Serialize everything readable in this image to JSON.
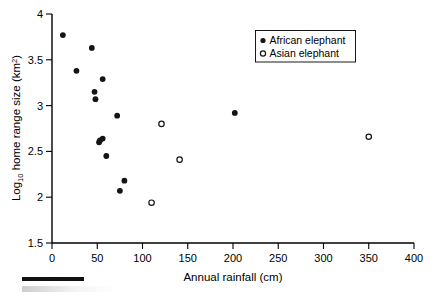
{
  "chart_data": {
    "type": "scatter",
    "title": "",
    "xlabel": "Annual rainfall (cm)",
    "ylabel": "Log10 home range size (km2)",
    "ylabel_parts": {
      "prefix": "Log",
      "sub": "10",
      "middle": " home range size (km",
      "sup": "2",
      "suffix": ")"
    },
    "xlim": [
      0,
      400
    ],
    "ylim": [
      1.5,
      4
    ],
    "xticks": [
      0,
      50,
      100,
      150,
      200,
      250,
      300,
      350,
      400
    ],
    "xtick_labels": [
      "0",
      "50",
      "100",
      "150",
      "200",
      "250",
      "300",
      "350",
      "400"
    ],
    "yticks": [
      1.5,
      2,
      2.5,
      3,
      3.5,
      4
    ],
    "ytick_labels": [
      "1.5",
      "2",
      "2.5",
      "3",
      "3.5",
      "4"
    ],
    "grid": false,
    "legend_position": "top-right",
    "series": [
      {
        "name": "African elephant",
        "marker": "filled-circle",
        "color": "#141414",
        "points": [
          {
            "x": 12,
            "y": 3.77
          },
          {
            "x": 27,
            "y": 3.38
          },
          {
            "x": 44,
            "y": 3.63
          },
          {
            "x": 47,
            "y": 3.15
          },
          {
            "x": 48,
            "y": 3.07
          },
          {
            "x": 56,
            "y": 3.29
          },
          {
            "x": 52,
            "y": 2.6
          },
          {
            "x": 53,
            "y": 2.62
          },
          {
            "x": 56,
            "y": 2.64
          },
          {
            "x": 60,
            "y": 2.45
          },
          {
            "x": 72,
            "y": 2.89
          },
          {
            "x": 75,
            "y": 2.07
          },
          {
            "x": 80,
            "y": 2.18
          },
          {
            "x": 202,
            "y": 2.92
          }
        ]
      },
      {
        "name": "Asian elephant",
        "marker": "open-circle",
        "color": "#141414",
        "points": [
          {
            "x": 110,
            "y": 1.94
          },
          {
            "x": 121,
            "y": 2.8
          },
          {
            "x": 141,
            "y": 2.41
          },
          {
            "x": 350,
            "y": 2.66
          }
        ]
      }
    ]
  },
  "legend": {
    "entries": [
      {
        "label": "African elephant",
        "marker": "filled-circle"
      },
      {
        "label": "Asian elephant",
        "marker": "open-circle"
      }
    ]
  },
  "caption": {
    "rule": "",
    "text": ""
  }
}
